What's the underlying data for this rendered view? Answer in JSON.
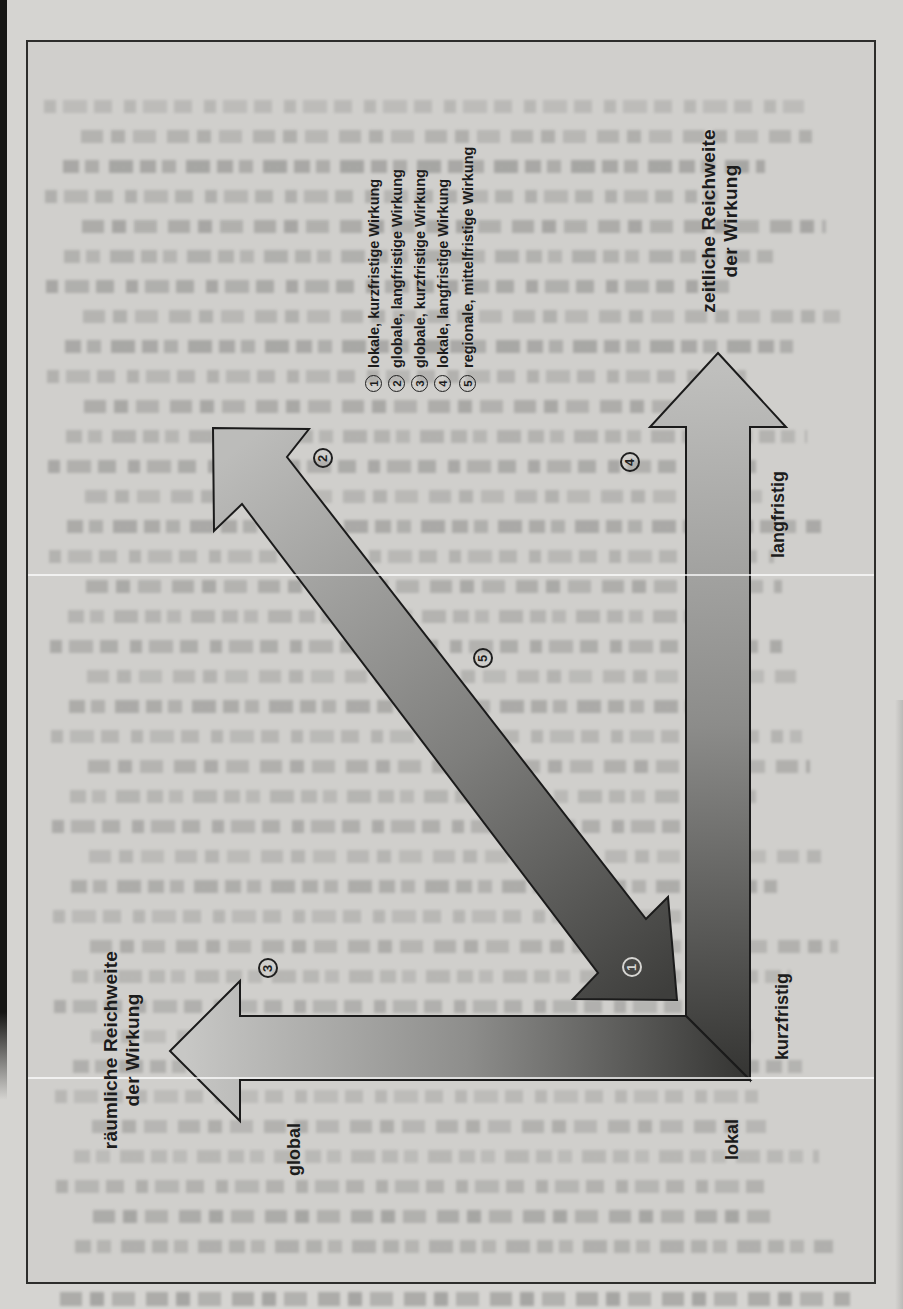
{
  "figure": {
    "legend": {
      "items": [
        {
          "num": "1",
          "label": "lokale, kurzfristige Wirkung"
        },
        {
          "num": "2",
          "label": "globale, langfristige Wirkung"
        },
        {
          "num": "3",
          "label": "globale, kurzfristige Wirkung"
        },
        {
          "num": "4",
          "label": "lokale, langfristige Wirkung"
        },
        {
          "num": "5",
          "label": "regionale, mittelfristige Wirkung"
        }
      ]
    },
    "axes": {
      "time": {
        "title_line1": "zeitliche Reichweite",
        "title_line2": "der Wirkung",
        "near_label": "kurzfristig",
        "far_label": "langfristig"
      },
      "space": {
        "title_line1": "räumliche Reichweite",
        "title_line2": "der Wirkung",
        "near_label": "lokal",
        "far_label": "global"
      }
    }
  },
  "colors": {
    "paper": "#d0cfcc",
    "ink": "#1c1c1c",
    "arrow_light": "#c4c4c2",
    "arrow_dark": "#353533"
  }
}
